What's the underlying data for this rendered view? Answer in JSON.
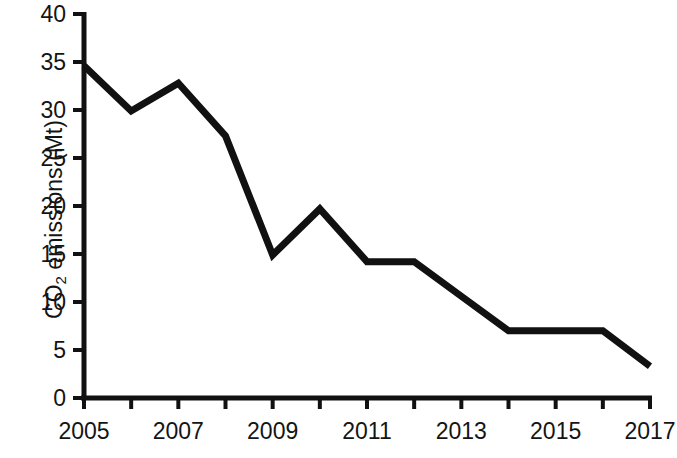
{
  "chart_data": {
    "type": "line",
    "title": "",
    "xlabel": "",
    "ylabel": "CO2 emissions (Mt)",
    "ylabel_prefix": "CO",
    "ylabel_sub": "2",
    "ylabel_suffix": " emissions (Mt)",
    "x": [
      2005,
      2006,
      2007,
      2008,
      2009,
      2010,
      2011,
      2012,
      2013,
      2014,
      2015,
      2016,
      2017
    ],
    "values": [
      34.6,
      29.9,
      32.8,
      27.3,
      14.9,
      19.7,
      14.2,
      14.2,
      10.6,
      7.0,
      7.0,
      7.0,
      3.3
    ],
    "series": [
      {
        "name": "CO2 emissions",
        "values": [
          34.6,
          29.9,
          32.8,
          27.3,
          14.9,
          19.7,
          14.2,
          14.2,
          10.6,
          7.0,
          7.0,
          7.0,
          3.3
        ]
      }
    ],
    "xlim": [
      2005,
      2017
    ],
    "ylim": [
      0,
      40
    ],
    "yticks": [
      0,
      5,
      10,
      15,
      20,
      25,
      30,
      35,
      40
    ],
    "ytick_labels": [
      "0",
      "5",
      "10",
      "15",
      "20",
      "25",
      "30",
      "35",
      "40"
    ],
    "xticks": [
      2005,
      2006,
      2007,
      2008,
      2009,
      2010,
      2011,
      2012,
      2013,
      2014,
      2015,
      2016,
      2017
    ],
    "xtick_labels_shown": [
      "2005",
      "2007",
      "2009",
      "2011",
      "2013",
      "2015",
      "2017"
    ],
    "xtick_labels_shown_values": [
      2005,
      2007,
      2009,
      2011,
      2013,
      2015,
      2017
    ],
    "grid": false,
    "legend": false,
    "legend_position": "none",
    "line_color": "#111111",
    "line_width": 7,
    "axis_color": "#111111",
    "background_color": "#ffffff"
  }
}
